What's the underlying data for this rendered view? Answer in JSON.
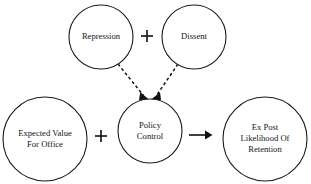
{
  "diagram": {
    "background_color": "#ffffff",
    "stroke_color": "#1a1a1a",
    "text_color": "#141414",
    "nodes": [
      {
        "id": "repression",
        "label": "Repression",
        "lines": [
          "Repression"
        ],
        "cx": 101,
        "cy": 37,
        "r": 32,
        "font_size": 8.6
      },
      {
        "id": "dissent",
        "label": "Dissent",
        "lines": [
          "Dissent"
        ],
        "cx": 194,
        "cy": 37,
        "r": 32,
        "font_size": 8.6
      },
      {
        "id": "expected-value-for-office",
        "label": "Expected Value For Office",
        "lines": [
          "Expected Value",
          "For Office"
        ],
        "cx": 45,
        "cy": 139,
        "r": 42,
        "font_size": 8.6
      },
      {
        "id": "policy-control",
        "label": "Policy Control",
        "lines": [
          "Policy",
          "Control"
        ],
        "cx": 150,
        "cy": 131,
        "r": 32,
        "font_size": 8.6
      },
      {
        "id": "ex-post-likelihood-of-retention",
        "label": "Ex Post Likelihood Of Retention",
        "lines": [
          "Ex Post",
          "Likelihood Of",
          "Retention"
        ],
        "cx": 265,
        "cy": 139,
        "r": 42,
        "font_size": 8.6
      }
    ],
    "operators": [
      {
        "id": "plus-repression-dissent",
        "symbol": "+",
        "cx": 147,
        "cy": 36,
        "size": 13
      },
      {
        "id": "plus-expected-value-policy",
        "symbol": "+",
        "cx": 101,
        "cy": 136,
        "size": 13
      }
    ],
    "edges": [
      {
        "id": "repression-to-policy-control",
        "from": "repression",
        "to": "policy-control",
        "style": "dashed",
        "arrow": "single",
        "x1": 118,
        "y1": 64,
        "x2": 145,
        "y2": 99
      },
      {
        "id": "dissent-to-policy-control",
        "from": "dissent",
        "to": "policy-control",
        "style": "dashed",
        "arrow": "single",
        "x1": 178,
        "y1": 64,
        "x2": 155,
        "y2": 99
      },
      {
        "id": "policy-control-to-retention",
        "from": "policy-control",
        "to": "ex-post-likelihood-of-retention",
        "style": "solid",
        "arrow": "single",
        "x1": 189,
        "y1": 135,
        "x2": 212,
        "y2": 135
      }
    ]
  }
}
